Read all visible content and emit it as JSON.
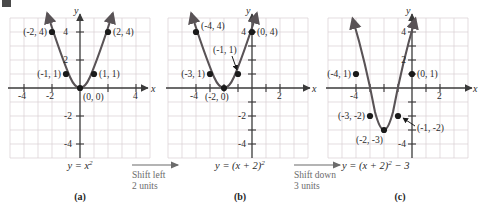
{
  "figure": {
    "panels": [
      {
        "id": "a",
        "letter": "(a)",
        "equation_html": "y = x<sup>2</sup>",
        "equation_text": "y = x^2",
        "axis_labels": {
          "x": "x",
          "y": "y"
        },
        "x_ticks": [
          "-4",
          "-2",
          "4"
        ],
        "y_ticks": [
          "4",
          "2",
          "-2",
          "-4"
        ],
        "points": [
          {
            "label": "(-2, 4)",
            "x": -2,
            "y": 4,
            "label_side": "left"
          },
          {
            "label": "(2, 4)",
            "x": 2,
            "y": 4,
            "label_side": "right"
          },
          {
            "label": "(-1, 1)",
            "x": -1,
            "y": 1,
            "label_side": "left"
          },
          {
            "label": "(1, 1)",
            "x": 1,
            "y": 1,
            "label_side": "right"
          },
          {
            "label": "(0, 0)",
            "x": 0,
            "y": 0,
            "label_side": "right-below"
          }
        ]
      },
      {
        "id": "b",
        "letter": "(b)",
        "equation_html": "y = (x + 2)<sup>2</sup>",
        "equation_text": "y = (x + 2)^2",
        "axis_labels": {
          "x": "x",
          "y": "y"
        },
        "x_ticks": [
          "-4",
          "2"
        ],
        "y_ticks": [
          "4",
          "-2",
          "-4"
        ],
        "points": [
          {
            "label": "(-4, 4)",
            "x": -4,
            "y": 4,
            "label_side": "right"
          },
          {
            "label": "(0, 4)",
            "x": 0,
            "y": 4,
            "label_side": "right"
          },
          {
            "label": "(-3, 1)",
            "x": -3,
            "y": 1,
            "label_side": "left"
          },
          {
            "label": "(-1, 1)",
            "x": -1,
            "y": 1,
            "label_side": "leader-up"
          },
          {
            "label": "(-2, 0)",
            "x": -2,
            "y": 0,
            "label_side": "below"
          }
        ]
      },
      {
        "id": "c",
        "letter": "(c)",
        "equation_html": "y = (x + 2)<sup>2</sup> &minus; 3",
        "equation_text": "y = (x + 2)^2 - 3",
        "axis_labels": {
          "x": "x",
          "y": "y"
        },
        "x_ticks": [
          "-4",
          "2"
        ],
        "y_ticks": [
          "4",
          "2",
          "-4"
        ],
        "points": [
          {
            "label": "(-4, 1)",
            "x": -4,
            "y": 1,
            "label_side": "left"
          },
          {
            "label": "(0, 1)",
            "x": 0,
            "y": 1,
            "label_side": "right"
          },
          {
            "label": "(-3, -2)",
            "x": -3,
            "y": -2,
            "label_side": "left"
          },
          {
            "label": "(-1, -2)",
            "x": -1,
            "y": -2,
            "label_side": "leader-right"
          },
          {
            "label": "(-2, -3)",
            "x": -2,
            "y": -3,
            "label_side": "below-left"
          }
        ]
      }
    ],
    "transitions": [
      {
        "id": "shift-left",
        "line1": "Shift left",
        "line2": "2 units"
      },
      {
        "id": "shift-down",
        "line1": "Shift down",
        "line2": "3 units"
      }
    ],
    "colors": {
      "curve": "#595356",
      "axis": "#3a3a3a",
      "grid": "#d9cfd2",
      "point": "#1a1a1a",
      "text": "#2b2b2b",
      "transition_text": "#6b6b6b",
      "background": "#ffffff"
    }
  },
  "chart_data": [
    {
      "type": "line",
      "title": "y = x^2",
      "panel": "a",
      "xlabel": "x",
      "ylabel": "y",
      "xlim": [
        -5,
        5
      ],
      "ylim": [
        -5,
        5
      ],
      "grid": true,
      "legend": "none",
      "series": [
        {
          "name": "y = x^2",
          "points": [
            {
              "x": -2,
              "y": 4
            },
            {
              "x": -1,
              "y": 1
            },
            {
              "x": 0,
              "y": 0
            },
            {
              "x": 1,
              "y": 1
            },
            {
              "x": 2,
              "y": 4
            }
          ]
        }
      ],
      "annotations": [
        "(-2,4)",
        "(2,4)",
        "(-1,1)",
        "(1,1)",
        "(0,0)"
      ]
    },
    {
      "type": "line",
      "title": "y = (x + 2)^2",
      "panel": "b",
      "xlabel": "x",
      "ylabel": "y",
      "xlim": [
        -6,
        4
      ],
      "ylim": [
        -5,
        5
      ],
      "grid": true,
      "legend": "none",
      "series": [
        {
          "name": "y = (x + 2)^2",
          "points": [
            {
              "x": -4,
              "y": 4
            },
            {
              "x": -3,
              "y": 1
            },
            {
              "x": -2,
              "y": 0
            },
            {
              "x": -1,
              "y": 1
            },
            {
              "x": 0,
              "y": 4
            }
          ]
        }
      ],
      "annotations": [
        "(-4,4)",
        "(0,4)",
        "(-3,1)",
        "(-1,1)",
        "(-2,0)"
      ]
    },
    {
      "type": "line",
      "title": "y = (x + 2)^2 - 3",
      "panel": "c",
      "xlabel": "x",
      "ylabel": "y",
      "xlim": [
        -6,
        4
      ],
      "ylim": [
        -5,
        5
      ],
      "grid": true,
      "legend": "none",
      "series": [
        {
          "name": "y = (x + 2)^2 - 3",
          "points": [
            {
              "x": -4,
              "y": 1
            },
            {
              "x": -3,
              "y": -2
            },
            {
              "x": -2,
              "y": -3
            },
            {
              "x": -1,
              "y": -2
            },
            {
              "x": 0,
              "y": 1
            }
          ]
        }
      ],
      "annotations": [
        "(-4,1)",
        "(0,1)",
        "(-3,-2)",
        "(-1,-2)",
        "(-2,-3)"
      ]
    }
  ]
}
